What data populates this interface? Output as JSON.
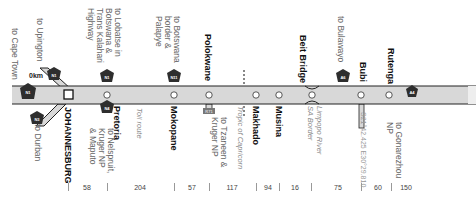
{
  "origin_marker": "0km",
  "route_color": "#d8d8d8",
  "shield_color": "#333333",
  "towns": [
    {
      "name": "JOHANNESBURG",
      "x": 68
    },
    {
      "name": "Pretoria",
      "x": 107
    },
    {
      "name": "Mokopane",
      "x": 174
    },
    {
      "name": "Polokwane",
      "x": 209
    },
    {
      "name": "Makhado",
      "x": 256
    },
    {
      "name": "Musina",
      "x": 279
    },
    {
      "name": "Beit Bridge",
      "x": 311
    },
    {
      "name": "Bubi",
      "x": 361
    },
    {
      "name": "Rutenga",
      "x": 389
    }
  ],
  "branches": {
    "cape_town": "to Cape Town",
    "upington": "to Upington",
    "durban": "to Durban",
    "lobatse": "to Lobatse in\nBotswana &\nTrans Kalahari\nHighway",
    "nelspruit": "to Nelspruit,\nKruger NP\n& Maputo",
    "botswana_palapye": "to Botswana\nborder &\nPalapye",
    "tzaneen": "to Tzaneen &\nKruger NP",
    "bulawayo": "to Bulawayo",
    "gonarezhou": "to Gonarezhou\nNP"
  },
  "annotations": {
    "toll_route": "Toll route",
    "tropic": "Tropic of Capricorn",
    "limpopo": "Limpopo River\nSA Border",
    "gps": "S21°42.425 E30°29.810"
  },
  "shields": {
    "sa": "N1",
    "zim": "A4",
    "regional": "R71"
  },
  "distances": [
    {
      "value": "58",
      "x": 87
    },
    {
      "value": "204",
      "x": 140
    },
    {
      "value": "57",
      "x": 192
    },
    {
      "value": "117",
      "x": 232
    },
    {
      "value": "94",
      "x": 268
    },
    {
      "value": "16",
      "x": 295
    },
    {
      "value": "75",
      "x": 338
    },
    {
      "value": "60",
      "x": 378
    },
    {
      "value": "150",
      "x": 406
    }
  ],
  "ticks": [
    68,
    107,
    174,
    209,
    256,
    279,
    311,
    361,
    391
  ]
}
